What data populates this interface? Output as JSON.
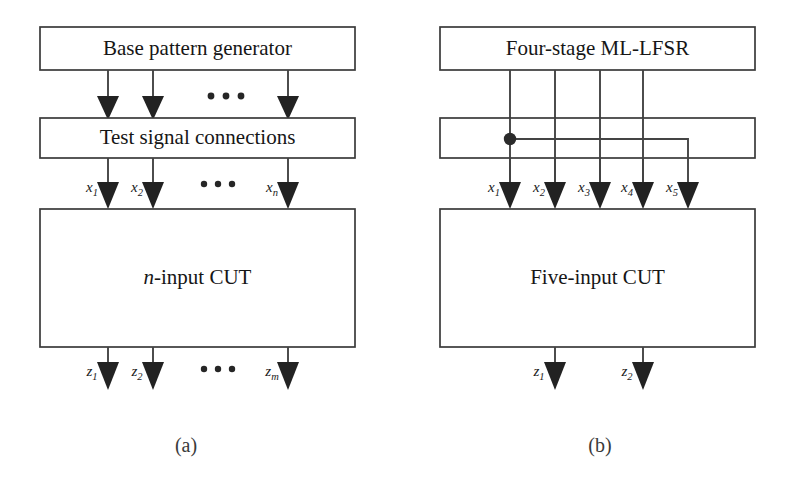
{
  "figure": {
    "panels": [
      {
        "id": "a",
        "caption": "(a)",
        "boxes": [
          {
            "name": "base-pattern-generator",
            "label": "Base pattern generator"
          },
          {
            "name": "test-signal-connections",
            "label": "Test signal connections"
          },
          {
            "name": "cut",
            "label_prefix": "n",
            "label_suffix": "-input CUT"
          }
        ],
        "inputs": [
          {
            "base": "x",
            "sub": "1"
          },
          {
            "base": "x",
            "sub": "2"
          },
          {
            "base": "x",
            "sub": "n"
          }
        ],
        "outputs": [
          {
            "base": "z",
            "sub": "1"
          },
          {
            "base": "z",
            "sub": "2"
          },
          {
            "base": "z",
            "sub": "m"
          }
        ],
        "ellipsis": "• • •"
      },
      {
        "id": "b",
        "caption": "(b)",
        "boxes": [
          {
            "name": "four-stage-ml-lfsr",
            "label": "Four-stage ML-LFSR"
          },
          {
            "name": "test-signal-connections",
            "label": ""
          },
          {
            "name": "cut",
            "label": "Five-input CUT"
          }
        ],
        "inputs": [
          {
            "base": "x",
            "sub": "1"
          },
          {
            "base": "x",
            "sub": "2"
          },
          {
            "base": "x",
            "sub": "3"
          },
          {
            "base": "x",
            "sub": "4"
          },
          {
            "base": "x",
            "sub": "5"
          }
        ],
        "outputs": [
          {
            "base": "z",
            "sub": "1"
          },
          {
            "base": "z",
            "sub": "2"
          }
        ],
        "junction": {
          "name": "fanout-junction-dot"
        }
      }
    ],
    "colors": {
      "line": "#444444",
      "box_stroke": "#3a3a3a",
      "text": "#161616",
      "background": "#ffffff",
      "arrowhead": "#222222"
    }
  }
}
